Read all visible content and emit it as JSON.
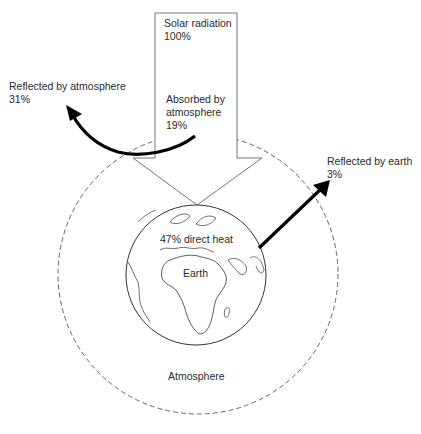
{
  "diagram": {
    "solar_radiation": {
      "label": "Solar radiation",
      "value": "100%"
    },
    "absorbed_by_atmosphere": {
      "label_line1": "Absorbed by",
      "label_line2": "atmosphere",
      "value": "19%"
    },
    "reflected_by_atmosphere": {
      "label": "Reflected by atmosphere",
      "value": "31%"
    },
    "reflected_by_earth": {
      "label": "Reflected by earth",
      "value": "3%"
    },
    "direct_heat": {
      "label": "47% direct heat"
    },
    "earth": {
      "label": "Earth"
    },
    "atmosphere": {
      "label": "Atmosphere"
    }
  }
}
